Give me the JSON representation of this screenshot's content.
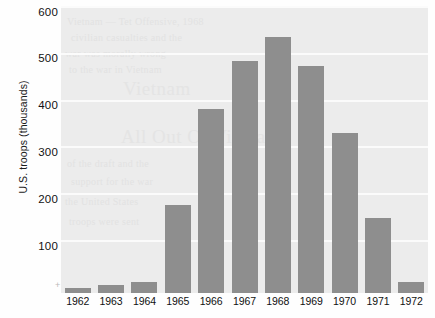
{
  "chart_data": {
    "type": "bar",
    "title": "",
    "xlabel": "",
    "ylabel": "U.S. troops (thousands)",
    "categories": [
      "1962",
      "1963",
      "1964",
      "1965",
      "1966",
      "1967",
      "1968",
      "1969",
      "1970",
      "1971",
      "1972"
    ],
    "values": [
      11,
      16,
      23,
      184,
      385,
      486,
      536,
      475,
      334,
      157,
      24
    ],
    "ylim": [
      0,
      600
    ],
    "yticks": [
      100,
      200,
      300,
      400,
      500,
      600
    ],
    "ytick_labels": [
      "100",
      "200",
      "300",
      "400",
      "500",
      "600"
    ],
    "grid": true,
    "grid_axis": "y",
    "legend": "none",
    "bar_color": "#8e8e8e",
    "plot_background": "#ececec",
    "gridline_color": "#fbfbfb"
  },
  "ghost_text": {
    "lines": [
      "Vietnam — Tet Offensive, 1968",
      "civilian casualties and the",
      "war was morally wrong",
      "to the war in Vietnam",
      "Vietnam",
      "All Out Of Vietnam",
      "of the draft and the",
      "support for the war",
      "the United States",
      "troops were sent"
    ]
  }
}
